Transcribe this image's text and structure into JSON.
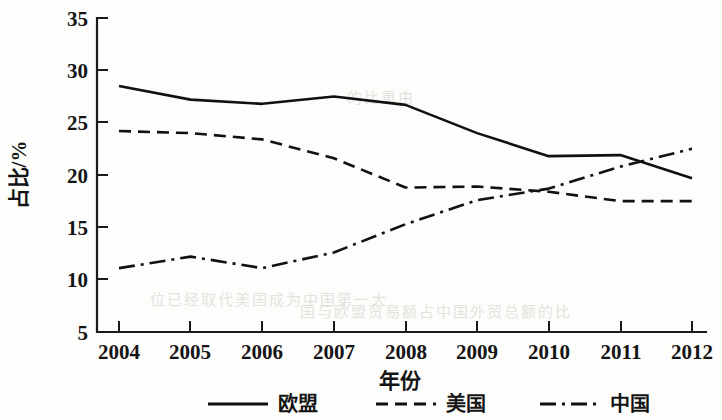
{
  "chart_data": {
    "type": "line",
    "title": "",
    "xlabel": "年份",
    "ylabel": "占比/%",
    "x": [
      2004,
      2005,
      2006,
      2007,
      2008,
      2009,
      2010,
      2011,
      2012
    ],
    "categories": [
      "2004",
      "2005",
      "2006",
      "2007",
      "2008",
      "2009",
      "2010",
      "2011",
      "2012"
    ],
    "xlim": [
      2004,
      2012
    ],
    "ylim": [
      5,
      35
    ],
    "yticks": [
      5,
      10,
      15,
      20,
      25,
      30,
      35
    ],
    "ytick_labels": [
      "5",
      "10",
      "15",
      "20",
      "25",
      "30",
      "35"
    ],
    "grid": false,
    "legend_position": "below",
    "series": [
      {
        "name": "欧盟",
        "style": "solid",
        "color": "#111111",
        "values": [
          28.5,
          27.2,
          26.8,
          27.5,
          26.7,
          24.0,
          21.8,
          21.9,
          19.7
        ]
      },
      {
        "name": "美国",
        "style": "dashed",
        "color": "#111111",
        "values": [
          24.2,
          24.0,
          23.4,
          21.6,
          18.8,
          18.9,
          18.4,
          17.5,
          17.5
        ]
      },
      {
        "name": "中国",
        "style": "dashdot",
        "color": "#111111",
        "values": [
          11.1,
          12.2,
          11.1,
          12.6,
          15.3,
          17.6,
          18.7,
          20.8,
          22.5
        ]
      }
    ]
  },
  "axis": {
    "y_label": "占比/%",
    "x_label": "年份",
    "y_ticks": [
      "35",
      "30",
      "25",
      "20",
      "15",
      "10",
      "5"
    ],
    "x_ticks": [
      "2004",
      "2005",
      "2006",
      "2007",
      "2008",
      "2009",
      "2010",
      "2011",
      "2012"
    ]
  },
  "legend": {
    "items": [
      {
        "label": "欧盟",
        "style": "solid"
      },
      {
        "label": "美国",
        "style": "dashed"
      },
      {
        "label": "中国",
        "style": "dashdot"
      }
    ]
  },
  "background_bleed": {
    "line1": "一的比重由",
    "line2": "位已经取代美国成为中国第一大",
    "line3": "国与欧盟贸易额占中国外贸总额的比"
  }
}
